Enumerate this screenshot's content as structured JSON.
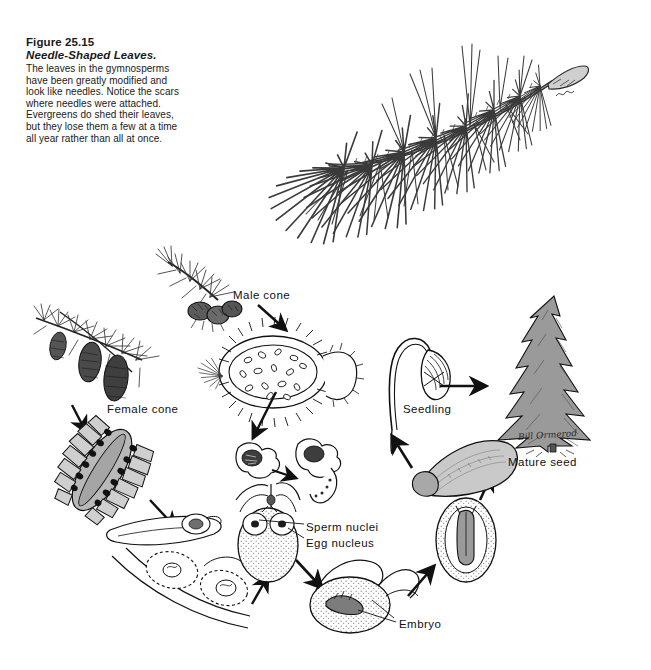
{
  "figure": {
    "number": "Figure 25.15",
    "title": "Needle-Shaped Leaves.",
    "body": "The leaves in the gymnosperms have been greatly modified and look like needles. Notice the scars where needles were attached. Evergreens do shed their leaves, but they lose them a few at a time all year rather than all at once."
  },
  "illustration_top": {
    "name": "pine-needle-branch-drawing",
    "description": "Pen-and-ink drawing of a pine branch with long needles in clusters and visible needle scars"
  },
  "life_cycle": {
    "name": "conifer-life-cycle-diagram",
    "labels": [
      {
        "id": "male-cone",
        "text": "Male cone",
        "x": 233,
        "y": 289
      },
      {
        "id": "female-cone",
        "text": "Female cone",
        "x": 107,
        "y": 403
      },
      {
        "id": "seedling",
        "text": "Seedling",
        "x": 403,
        "y": 403
      },
      {
        "id": "mature-seed",
        "text": "Mature seed",
        "x": 508,
        "y": 456
      },
      {
        "id": "sperm-nuclei",
        "text": "Sperm nuclei",
        "x": 306,
        "y": 521
      },
      {
        "id": "egg-nucleus",
        "text": "Egg nucleus",
        "x": 306,
        "y": 537
      },
      {
        "id": "embryo",
        "text": "Embryo",
        "x": 399,
        "y": 618
      }
    ],
    "stages": [
      "Pine branch bearing male cones",
      "Male cone longitudinal section with pollen sacs",
      "Winged pollen grains",
      "Pine branch bearing female cones",
      "Female cone longitudinal section with ovules",
      "Ovuliferous scale with ovule",
      "Ovule with archegonia containing sperm nuclei and egg nucleus",
      "Fertilized ovule developing embryo",
      "Seed containing embryo",
      "Mature winged seed",
      "Germinating seedling",
      "Mature pine tree"
    ]
  },
  "artist_signature": {
    "text": "Bill Ormerod",
    "visible_as": "cursive signature at base of mature tree"
  },
  "colors": {
    "background": "#ffffff",
    "ink": "#111111",
    "tree_fill": "#9a9a9a",
    "cone_fill": "#bdbdbd",
    "stipple": "#d8d8d8"
  }
}
